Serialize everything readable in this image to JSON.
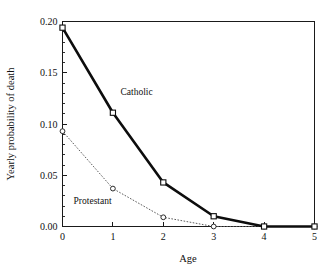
{
  "chart_data": {
    "type": "line",
    "title": "",
    "xlabel": "Age",
    "ylabel": "Yearly probability of death",
    "x": [
      0,
      1,
      2,
      3,
      4,
      5
    ],
    "xlim": [
      0,
      5
    ],
    "ylim": [
      0.0,
      0.2
    ],
    "grid": false,
    "legend_position": "inline-annotations",
    "xticks": [
      "0",
      "1",
      "2",
      "3",
      "4",
      "5"
    ],
    "yticks": [
      "0.00",
      "0.05",
      "0.10",
      "0.15",
      "0.20"
    ],
    "ytick_values": [
      0.0,
      0.05,
      0.1,
      0.15,
      0.2
    ],
    "minor_ticks": true,
    "series": [
      {
        "name": "Catholic",
        "marker": "square",
        "line_style": "solid-thick",
        "color": "#0d0d0d",
        "values": [
          0.194,
          0.111,
          0.043,
          0.01,
          0.0,
          0.0
        ],
        "annotation": {
          "text": "Catholic",
          "x": 1.15,
          "y": 0.128
        }
      },
      {
        "name": "Protestant",
        "marker": "circle",
        "line_style": "dotted-thin",
        "color": "#5d5d5d",
        "values": [
          0.093,
          0.037,
          0.009,
          0.0,
          0.0,
          0.0
        ],
        "annotation": {
          "text": "Protestant",
          "x": 0.22,
          "y": 0.022
        }
      }
    ]
  }
}
